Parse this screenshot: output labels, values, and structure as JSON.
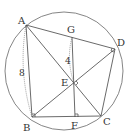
{
  "diagram": {
    "type": "geometry",
    "circle": {
      "cx": 64,
      "cy": 71,
      "r": 59
    },
    "points": {
      "A": {
        "x": 26,
        "y": 25,
        "label": "A",
        "lx": 18,
        "ly": 24
      },
      "B": {
        "x": 32,
        "y": 117,
        "label": "B",
        "lx": 23,
        "ly": 131
      },
      "C": {
        "x": 101,
        "y": 116,
        "label": "C",
        "lx": 103,
        "ly": 125
      },
      "D": {
        "x": 115,
        "y": 49,
        "label": "D",
        "lx": 117,
        "ly": 46
      },
      "E": {
        "x": 74,
        "y": 83,
        "label": "E",
        "lx": 61,
        "ly": 86
      },
      "F": {
        "x": 75,
        "y": 117,
        "label": "F",
        "lx": 71,
        "ly": 129
      },
      "G": {
        "x": 72,
        "y": 37,
        "label": "G",
        "lx": 67,
        "ly": 33
      }
    },
    "segments": [
      "AB",
      "BC",
      "CD",
      "DA",
      "AC",
      "BD",
      "GF"
    ],
    "measures": [
      {
        "label": "8",
        "between": "A-B",
        "x": 19,
        "y": 76
      },
      {
        "label": "4",
        "between": "G-E",
        "x": 65,
        "y": 64
      }
    ],
    "right_angles": [
      "B",
      "D",
      "E",
      "F"
    ],
    "stroke_color": "#555555",
    "arc_color": "#777777"
  }
}
